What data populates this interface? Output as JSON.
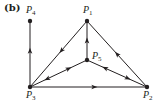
{
  "panel_label": "(b)",
  "colors": {
    "stroke": "#231f20",
    "background": "#ffffff"
  },
  "nodes": [
    {
      "id": "P1",
      "label": "P",
      "sub": "1",
      "x": 87,
      "y": 21,
      "label_x": 83,
      "label_y": 5
    },
    {
      "id": "P2",
      "label": "P",
      "sub": "2",
      "x": 147,
      "y": 87,
      "label_x": 143,
      "label_y": 90
    },
    {
      "id": "P3",
      "label": "P",
      "sub": "3",
      "x": 30,
      "y": 87,
      "label_x": 26,
      "label_y": 90
    },
    {
      "id": "P4",
      "label": "P",
      "sub": "4",
      "x": 30,
      "y": 21,
      "label_x": 26,
      "label_y": 5
    },
    {
      "id": "P5",
      "label": "P",
      "sub": "5",
      "x": 87,
      "y": 60,
      "label_x": 92,
      "label_y": 51
    }
  ],
  "edges": [
    {
      "from": "P3",
      "to": "P4",
      "arrows": [
        {
          "t": 0.55,
          "dir": "forward"
        }
      ]
    },
    {
      "from": "P1",
      "to": "P3",
      "arrows": [
        {
          "t": 0.45,
          "dir": "forward"
        }
      ]
    },
    {
      "from": "P2",
      "to": "P1",
      "arrows": [
        {
          "t": 0.5,
          "dir": "forward"
        }
      ]
    },
    {
      "from": "P5",
      "to": "P1",
      "arrows": [
        {
          "t": 0.5,
          "dir": "forward"
        }
      ]
    },
    {
      "from": "P3",
      "to": "P5",
      "arrows": [
        {
          "t": 0.3,
          "dir": "backward"
        },
        {
          "t": 0.68,
          "dir": "forward"
        }
      ]
    },
    {
      "from": "P5",
      "to": "P2",
      "arrows": [
        {
          "t": 0.3,
          "dir": "backward"
        },
        {
          "t": 0.68,
          "dir": "forward"
        }
      ]
    },
    {
      "from": "P3",
      "to": "P2",
      "arrows": [
        {
          "t": 0.55,
          "dir": "forward"
        }
      ]
    }
  ]
}
